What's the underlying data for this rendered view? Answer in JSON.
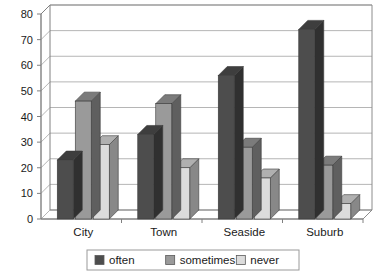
{
  "chart_data": {
    "type": "bar",
    "title": "",
    "subtitle": "",
    "xlabel": "",
    "ylabel": "",
    "categories": [
      "City",
      "Town",
      "Seaside",
      "Suburb"
    ],
    "series": [
      {
        "name": "often",
        "values": [
          23,
          33,
          56,
          74
        ],
        "color": "#4d4d4d"
      },
      {
        "name": "sometimes",
        "values": [
          46,
          45,
          28,
          21
        ],
        "color": "#9a9a9a"
      },
      {
        "name": "never",
        "values": [
          29,
          20,
          16,
          6
        ],
        "color": "#dcdcdc"
      }
    ],
    "ylim": [
      0,
      80
    ],
    "yticks": [
      0,
      10,
      20,
      30,
      40,
      50,
      60,
      70,
      80
    ],
    "ytick_labels": [
      "0",
      "10",
      "20",
      "30",
      "40",
      "50",
      "60",
      "70",
      "80"
    ],
    "grid": true,
    "grid_axis": "y",
    "legend_position": "bottom",
    "style": "3d-column",
    "plot_background": "#ffffff",
    "grid_color": "#b5b5b5",
    "axis_color": "#808080",
    "border_color": "#8c8c8c"
  },
  "legend": {
    "items": [
      {
        "label": "often",
        "swatch": "#4d4d4d"
      },
      {
        "label": "sometimes",
        "swatch": "#9a9a9a"
      },
      {
        "label": "never",
        "swatch": "#dcdcdc"
      }
    ]
  }
}
